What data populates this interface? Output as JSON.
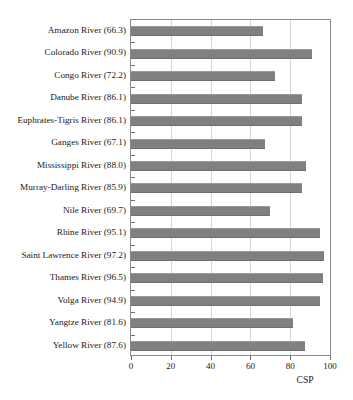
{
  "chart_data": {
    "type": "bar",
    "orientation": "horizontal",
    "title": "",
    "xlabel": "CSP",
    "ylabel": "",
    "xlim": [
      0,
      100
    ],
    "xticks": [
      0,
      20,
      40,
      60,
      80,
      100
    ],
    "grid": true,
    "legend": false,
    "bar_color": "#808080",
    "categories": [
      "Amazon River",
      "Colorado River",
      "Congo River",
      "Danube River",
      "Euphrates-Tigris River",
      "Ganges River",
      "Mississippi River",
      "Murray-Darling River",
      "Nile River",
      "Rhine River",
      "Saint Lawrence River",
      "Thames River",
      "Volga River",
      "Yangtze River",
      "Yellow River"
    ],
    "values": [
      66.3,
      90.9,
      72.2,
      86.1,
      86.1,
      67.1,
      88.0,
      85.9,
      69.7,
      95.1,
      97.2,
      96.5,
      94.9,
      81.6,
      87.6
    ],
    "category_labels": [
      "Amazon River (66.3)",
      "Colorado River (90.9)",
      "Congo River (72.2)",
      "Danube River (86.1)",
      "Euphrates-Tigris River (86.1)",
      "Ganges River (67.1)",
      "Mississippi River (88.0)",
      "Murray-Darling River (85.9)",
      "Nile River (69.7)",
      "Rhine River (95.1)",
      "Saint Lawrence River (97.2)",
      "Thames River (96.5)",
      "Volga River (94.9)",
      "Yangtze River (81.6)",
      "Yellow River (87.6)"
    ],
    "xtick_labels": [
      "0",
      "20",
      "40",
      "60",
      "80",
      "100"
    ]
  }
}
